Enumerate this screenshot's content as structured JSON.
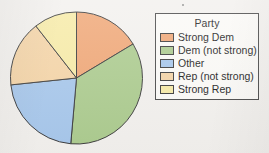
{
  "chart_data": {
    "type": "pie",
    "title": "",
    "legend_title": "Party",
    "legend_position": "right",
    "categories": [
      "Strong Dem",
      "Dem (not strong)",
      "Other",
      "Rep (not strong)",
      "Strong Rep"
    ],
    "values": [
      16.4,
      35.0,
      22.0,
      16.1,
      10.5
    ],
    "units": "percent",
    "start_angle_deg": 0,
    "direction": "clockwise",
    "slice_angles_deg": [
      59,
      126,
      79,
      58,
      38
    ],
    "colors": [
      "#f0a878",
      "#adcc90",
      "#a8c8ec",
      "#f5d5a8",
      "#f7eba8"
    ],
    "slice_border_color": "#3d3d3d",
    "grid": false,
    "xlabel": "",
    "ylabel": ""
  },
  "legend": {
    "title": "Party",
    "entries": [
      {
        "label": "Strong Dem",
        "color": "#f0a878"
      },
      {
        "label": "Dem (not strong)",
        "color": "#adcc90"
      },
      {
        "label": "Other",
        "color": "#a8c8ec"
      },
      {
        "label": "Rep (not strong)",
        "color": "#f5d5a8"
      },
      {
        "label": "Strong Rep",
        "color": "#f7eba8"
      }
    ]
  },
  "pie": {
    "center_x": 76.5,
    "center_y": 78,
    "radius": 66
  }
}
